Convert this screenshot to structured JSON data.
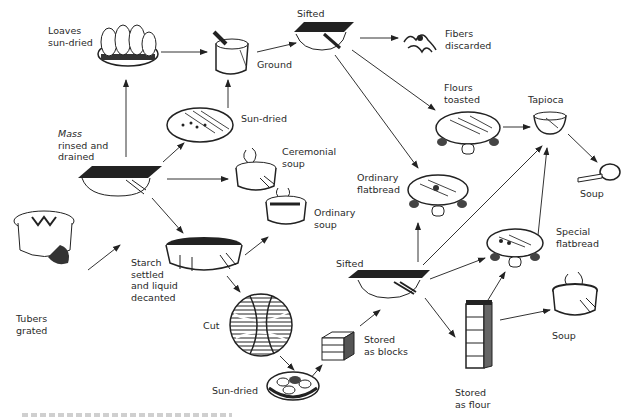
{
  "diagram": {
    "type": "process-flow",
    "nodes": [
      {
        "id": "tubers",
        "label": "Tubers\ngrated",
        "icon": "grated-tubers-icon"
      },
      {
        "id": "mass",
        "label_italic": "Mass",
        "label": "rinsed and\ndrained",
        "icon": "sieve-icon"
      },
      {
        "id": "loaves",
        "label": "Loaves\nsun-dried",
        "icon": "loaves-basket-icon"
      },
      {
        "id": "sundried1",
        "label": "Sun-dried",
        "icon": "drying-tray-icon"
      },
      {
        "id": "ground",
        "label": "Ground",
        "icon": "mortar-pestle-icon"
      },
      {
        "id": "sifted1",
        "label": "Sifted",
        "icon": "sieve-icon"
      },
      {
        "id": "fibers",
        "label": "Fibers\ndiscarded",
        "icon": "fibers-icon"
      },
      {
        "id": "flours",
        "label": "Flours\ntoasted",
        "icon": "griddle-icon"
      },
      {
        "id": "tapioca",
        "label": "Tapioca",
        "icon": "bowl-icon"
      },
      {
        "id": "soup1",
        "label": "Soup",
        "icon": "ladle-icon"
      },
      {
        "id": "ceremonial",
        "label": "Ceremonial\nsoup",
        "icon": "pot-icon"
      },
      {
        "id": "ordsoup",
        "label": "Ordinary\nsoup",
        "icon": "pot-icon"
      },
      {
        "id": "ordflat",
        "label": "Ordinary\nflatbread",
        "icon": "griddle-icon"
      },
      {
        "id": "starch",
        "label": "Starch\nsettled\nand liquid\ndecanted",
        "icon": "basin-icon"
      },
      {
        "id": "cut",
        "label": "Cut",
        "icon": "cut-starch-icon"
      },
      {
        "id": "sundried2",
        "label": "Sun-dried",
        "icon": "dried-pieces-icon"
      },
      {
        "id": "blocks",
        "label": "Stored\nas blocks",
        "icon": "blocks-icon"
      },
      {
        "id": "sifted2",
        "label": "Sifted",
        "icon": "sieve-icon"
      },
      {
        "id": "specflat",
        "label": "Special\nflatbread",
        "icon": "griddle-icon"
      },
      {
        "id": "flour",
        "label": "Stored\nas flour",
        "icon": "flour-column-icon"
      },
      {
        "id": "soup2",
        "label": "Soup",
        "icon": "pot-icon"
      }
    ],
    "edges": [
      [
        "tubers",
        "mass"
      ],
      [
        "mass",
        "loaves"
      ],
      [
        "mass",
        "sundried1"
      ],
      [
        "mass",
        "ceremonial"
      ],
      [
        "mass",
        "starch"
      ],
      [
        "loaves",
        "ground"
      ],
      [
        "sundried1",
        "ground"
      ],
      [
        "ground",
        "sifted1"
      ],
      [
        "sifted1",
        "fibers"
      ],
      [
        "sifted1",
        "flours"
      ],
      [
        "sifted1",
        "ordflat"
      ],
      [
        "flours",
        "tapioca"
      ],
      [
        "tapioca",
        "soup1"
      ],
      [
        "starch",
        "ordsoup"
      ],
      [
        "starch",
        "cut"
      ],
      [
        "cut",
        "sundried2"
      ],
      [
        "sundried2",
        "blocks"
      ],
      [
        "blocks",
        "sifted2"
      ],
      [
        "sifted2",
        "ordflat"
      ],
      [
        "sifted2",
        "tapioca"
      ],
      [
        "sifted2",
        "specflat"
      ],
      [
        "sifted2",
        "flour"
      ],
      [
        "flour",
        "specflat"
      ],
      [
        "flour",
        "soup2"
      ],
      [
        "specflat",
        "tapioca"
      ]
    ]
  },
  "labels": {
    "tubers": [
      "Tubers",
      "grated"
    ],
    "mass_italic": "Mass",
    "mass": [
      "rinsed and",
      "drained"
    ],
    "loaves": [
      "Loaves",
      "sun-dried"
    ],
    "sundried1": "Sun-dried",
    "ground": "Ground",
    "sifted1": "Sifted",
    "fibers": [
      "Fibers",
      "discarded"
    ],
    "flours": [
      "Flours",
      "toasted"
    ],
    "tapioca": "Tapioca",
    "soup1": "Soup",
    "ceremonial": [
      "Ceremonial",
      "soup"
    ],
    "ordsoup": [
      "Ordinary",
      "soup"
    ],
    "ordflat": [
      "Ordinary",
      "flatbread"
    ],
    "starch": [
      "Starch",
      "settled",
      "and liquid",
      "decanted"
    ],
    "cut": "Cut",
    "sundried2": "Sun-dried",
    "blocks": [
      "Stored",
      "as blocks"
    ],
    "sifted2": "Sifted",
    "specflat": [
      "Special",
      "flatbread"
    ],
    "flour": [
      "Stored",
      "as flour"
    ],
    "soup2": "Soup"
  }
}
